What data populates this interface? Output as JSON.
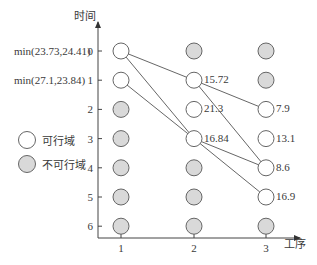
{
  "axes": {
    "y_title": "时间",
    "x_title": "工序",
    "y_ticks": [
      "0",
      "1",
      "2",
      "3",
      "4",
      "5",
      "6"
    ],
    "x_ticks": [
      "1",
      "2",
      "3"
    ]
  },
  "row_expressions": [
    {
      "row": 0,
      "text": "min(23.73,24.41)"
    },
    {
      "row": 1,
      "text": "min(27.1,23.84)"
    }
  ],
  "legend": {
    "feasible_label": "可行域",
    "infeasible_label": "不可行域"
  },
  "colors": {
    "feasible_fill": "#ffffff",
    "infeasible_fill": "#d9d9d9",
    "stroke": "#666666",
    "line": "#555555"
  },
  "nodes": [
    {
      "col": 1,
      "row": 0,
      "feasible": true,
      "value": ""
    },
    {
      "col": 1,
      "row": 1,
      "feasible": true,
      "value": ""
    },
    {
      "col": 1,
      "row": 2,
      "feasible": false,
      "value": ""
    },
    {
      "col": 1,
      "row": 3,
      "feasible": false,
      "value": ""
    },
    {
      "col": 1,
      "row": 4,
      "feasible": false,
      "value": ""
    },
    {
      "col": 1,
      "row": 5,
      "feasible": false,
      "value": ""
    },
    {
      "col": 1,
      "row": 6,
      "feasible": false,
      "value": ""
    },
    {
      "col": 2,
      "row": 0,
      "feasible": false,
      "value": ""
    },
    {
      "col": 2,
      "row": 1,
      "feasible": true,
      "value": "15.72"
    },
    {
      "col": 2,
      "row": 2,
      "feasible": true,
      "value": "21.3"
    },
    {
      "col": 2,
      "row": 3,
      "feasible": true,
      "value": "16.84"
    },
    {
      "col": 2,
      "row": 4,
      "feasible": false,
      "value": ""
    },
    {
      "col": 2,
      "row": 5,
      "feasible": false,
      "value": ""
    },
    {
      "col": 2,
      "row": 6,
      "feasible": false,
      "value": ""
    },
    {
      "col": 3,
      "row": 0,
      "feasible": false,
      "value": ""
    },
    {
      "col": 3,
      "row": 1,
      "feasible": false,
      "value": ""
    },
    {
      "col": 3,
      "row": 2,
      "feasible": true,
      "value": "7.9"
    },
    {
      "col": 3,
      "row": 3,
      "feasible": true,
      "value": "13.1"
    },
    {
      "col": 3,
      "row": 4,
      "feasible": true,
      "value": "8.6"
    },
    {
      "col": 3,
      "row": 5,
      "feasible": true,
      "value": "16.9"
    },
    {
      "col": 3,
      "row": 6,
      "feasible": false,
      "value": ""
    }
  ],
  "edges": [
    {
      "from": [
        1,
        0
      ],
      "to": [
        2,
        1
      ]
    },
    {
      "from": [
        1,
        0
      ],
      "to": [
        2,
        3
      ]
    },
    {
      "from": [
        1,
        1
      ],
      "to": [
        2,
        3
      ]
    },
    {
      "from": [
        2,
        1
      ],
      "to": [
        3,
        2
      ]
    },
    {
      "from": [
        2,
        1
      ],
      "to": [
        3,
        4
      ]
    },
    {
      "from": [
        2,
        3
      ],
      "to": [
        3,
        4
      ]
    },
    {
      "from": [
        2,
        3
      ],
      "to": [
        3,
        5
      ]
    }
  ]
}
